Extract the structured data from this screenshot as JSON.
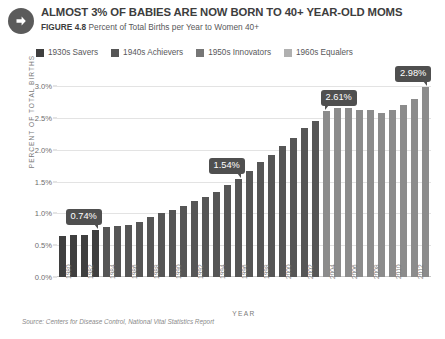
{
  "header": {
    "arrow_icon": "arrow-right-icon",
    "title": "ALMOST 3% OF BABIES ARE NOW BORN TO 40+ YEAR-OLD MOMS",
    "figure_label": "FIGURE 4.8",
    "figure_caption": "Percent of Total Births per Year to Women 40+"
  },
  "legend": {
    "items": [
      {
        "label": "1930s Savers",
        "color": "#3f3f3f"
      },
      {
        "label": "1940s Achievers",
        "color": "#565656"
      },
      {
        "label": "1950s Innovators",
        "color": "#767676"
      },
      {
        "label": "1960s Equalers",
        "color": "#b0b0b0"
      }
    ]
  },
  "source": "Source: Centers for Disease Control, National Vital Statistics Report",
  "chart_data": {
    "type": "bar",
    "title": "Percent of Total Births per Year to Women 40+",
    "xlabel": "YEAR",
    "ylabel": "PERCENT OF TOTAL BIRTHS",
    "ylim": [
      0.0,
      3.0
    ],
    "yticks": [
      "0.0%",
      "0.5%",
      "1.0%",
      "1.5%",
      "2.0%",
      "2.5%",
      "3.0%"
    ],
    "ytick_values": [
      0.0,
      0.5,
      1.0,
      1.5,
      2.0,
      2.5,
      3.0
    ],
    "grid": true,
    "legend_position": "top",
    "xtick_labels": [
      "1980",
      "1982",
      "1984",
      "1986",
      "1988",
      "1990",
      "1992",
      "1994",
      "1996",
      "1998",
      "2000",
      "2002",
      "2004",
      "2006",
      "2008",
      "2010",
      "2012"
    ],
    "categories": [
      "1980",
      "1981",
      "1982",
      "1983",
      "1984",
      "1985",
      "1986",
      "1987",
      "1988",
      "1989",
      "1990",
      "1991",
      "1992",
      "1993",
      "1994",
      "1995",
      "1996",
      "1997",
      "1998",
      "1999",
      "2000",
      "2001",
      "2002",
      "2003",
      "2004",
      "2005",
      "2006",
      "2007",
      "2008",
      "2009",
      "2010",
      "2011",
      "2012",
      "2013"
    ],
    "values": [
      0.64,
      0.66,
      0.66,
      0.74,
      0.78,
      0.8,
      0.82,
      0.86,
      0.94,
      1.0,
      1.06,
      1.12,
      1.2,
      1.26,
      1.34,
      1.45,
      1.54,
      1.66,
      1.8,
      1.92,
      2.05,
      2.18,
      2.34,
      2.45,
      2.61,
      2.66,
      2.66,
      2.62,
      2.62,
      2.58,
      2.62,
      2.7,
      2.8,
      2.98
    ],
    "series_groups": [
      {
        "name": "1930s Savers",
        "color": "#3f3f3f",
        "start_year": "1980",
        "end_year": "1983"
      },
      {
        "name": "1940s Achievers",
        "color": "#565656",
        "start_year": "1984",
        "end_year": "2003"
      },
      {
        "name": "1950s Innovators",
        "color": "#767676",
        "start_year": "2004",
        "end_year": "2013"
      },
      {
        "name": "1960s Equalers",
        "color": "#b0b0b0",
        "start_year": "",
        "end_year": ""
      }
    ],
    "bar_colors": [
      "#3f3f3f",
      "#3f3f3f",
      "#3f3f3f",
      "#3f3f3f",
      "#565656",
      "#565656",
      "#565656",
      "#565656",
      "#565656",
      "#565656",
      "#565656",
      "#565656",
      "#565656",
      "#565656",
      "#565656",
      "#565656",
      "#565656",
      "#565656",
      "#565656",
      "#565656",
      "#565656",
      "#565656",
      "#565656",
      "#565656",
      "#8c8c8c",
      "#8c8c8c",
      "#8c8c8c",
      "#8c8c8c",
      "#8c8c8c",
      "#8c8c8c",
      "#8c8c8c",
      "#8c8c8c",
      "#8c8c8c",
      "#8c8c8c"
    ],
    "annotations": [
      {
        "label": "0.74%",
        "year": "1983",
        "value": 0.74,
        "tail": "tail-right"
      },
      {
        "label": "1.54%",
        "year": "1996",
        "value": 1.54,
        "tail": "tail-right"
      },
      {
        "label": "2.61%",
        "year": "2004",
        "value": 2.61,
        "tail": "tail-left"
      },
      {
        "label": "2.98%",
        "year": "2013",
        "value": 2.98,
        "tail": "tail-right"
      }
    ]
  }
}
